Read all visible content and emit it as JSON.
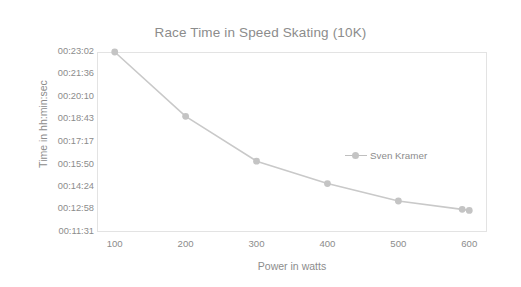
{
  "chart_data": {
    "type": "line",
    "title": "Race Time in Speed Skating (10K)",
    "xlabel": "Power in watts",
    "ylabel": "Time in hh:min:sec",
    "grid": false,
    "legend_position": "inside-right",
    "x_tick_labels": [
      "100",
      "200",
      "300",
      "400",
      "500",
      "600"
    ],
    "x_ticks": [
      100,
      200,
      300,
      400,
      500,
      600
    ],
    "xlim": [
      75,
      625
    ],
    "y_tick_labels": [
      "00:23:02",
      "00:21:36",
      "00:20:10",
      "00:18:43",
      "00:17:17",
      "00:15:50",
      "00:14:24",
      "00:12:58",
      "00:11:31"
    ],
    "y_ticks_seconds": [
      1382,
      1296,
      1210,
      1123,
      1037,
      950,
      864,
      778,
      691
    ],
    "ylim_seconds": [
      691,
      1382
    ],
    "series": [
      {
        "name": "Sven Kramer",
        "color": "#c4c4c4",
        "x": [
          100,
          200,
          300,
          400,
          500,
          590,
          600
        ],
        "y_labels": [
          "00:23:02",
          "00:18:55",
          "00:16:03",
          "00:14:37",
          "00:13:30",
          "00:12:58",
          "00:12:54"
        ],
        "y_seconds": [
          1382,
          1135,
          963,
          877,
          810,
          778,
          774
        ]
      }
    ]
  },
  "legend": {
    "entries": [
      {
        "label": "Sven Kramer"
      }
    ]
  },
  "colors": {
    "series": "#c4c4c4",
    "line": "#c9c9c9",
    "text": "#8c8c8c",
    "frame": "#e3e3e3",
    "background": "#ffffff"
  }
}
